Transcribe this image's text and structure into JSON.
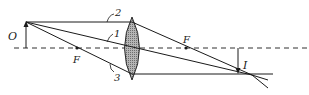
{
  "diagram": {
    "labels": {
      "object": "O",
      "image": "I",
      "focal_left": "F",
      "focal_right": "F",
      "ray1": "1",
      "ray2": "2",
      "ray3": "3"
    },
    "colors": {
      "ink": "#1a1a1a",
      "lens_fill": "#9a9a9a"
    }
  }
}
